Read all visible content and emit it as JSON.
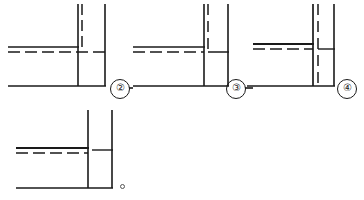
{
  "page": {
    "title": "Technical line drawings — four junction section views",
    "background_color": "#ffffff",
    "line_color": "#1a1a1a",
    "width": 364,
    "height": 200
  },
  "figures": [
    {
      "id": "figure-1",
      "label": "②",
      "label_name": "figure-label-2",
      "description": "Section junction view with solid outline, dashed centre line and dashed hidden vertical line",
      "origin": {
        "x": 8,
        "y": 4
      },
      "size": {
        "width": 108,
        "height": 86
      },
      "elements": {
        "vertical_solid_left": {
          "x": 78,
          "y1": 4,
          "y2": 86
        },
        "vertical_solid_right": {
          "x": 105,
          "y1": 4,
          "y2": 86
        },
        "vertical_dashed": {
          "x": 82,
          "y1": 4,
          "y2": 52
        },
        "horizontal_solid_upper": {
          "y": 47,
          "x1": 8,
          "x2": 78
        },
        "horizontal_dashed_center": {
          "y": 52,
          "x1": 8,
          "x2": 110
        },
        "horizontal_solid_bottom": {
          "y": 86,
          "x1": 8,
          "x2": 105
        }
      }
    },
    {
      "id": "figure-2",
      "label": "③",
      "label_name": "figure-label-3",
      "description": "Section junction view with solid outline, dashed centre line and short dashed hidden vertical line",
      "origin": {
        "x": 133,
        "y": 4
      },
      "size": {
        "width": 108,
        "height": 86
      },
      "elements": {
        "vertical_solid_left": {
          "x": 204,
          "y1": 4,
          "y2": 86
        },
        "vertical_solid_right": {
          "x": 228,
          "y1": 4,
          "y2": 86
        },
        "vertical_dashed": {
          "x": 208,
          "y1": 4,
          "y2": 52
        },
        "horizontal_solid_upper": {
          "y": 47,
          "x1": 133,
          "x2": 204
        },
        "horizontal_dashed_center": {
          "y": 52,
          "x1": 133,
          "x2": 204
        },
        "horizontal_solid_right_stub": {
          "y": 52,
          "x1": 208,
          "x2": 228
        },
        "horizontal_solid_bottom": {
          "y": 86,
          "x1": 133,
          "x2": 228
        }
      }
    },
    {
      "id": "figure-3",
      "label": "④",
      "label_name": "figure-label-4",
      "description": "Section junction view with full-height dashed hidden vertical line alongside solid vertical line",
      "origin": {
        "x": 253,
        "y": 4
      },
      "size": {
        "width": 100,
        "height": 86
      },
      "elements": {
        "vertical_solid_left": {
          "x": 313,
          "y1": 4,
          "y2": 86
        },
        "vertical_solid_right": {
          "x": 334,
          "y1": 4,
          "y2": 86
        },
        "vertical_dashed": {
          "x": 318,
          "y1": 4,
          "y2": 86
        },
        "horizontal_solid_upper": {
          "y": 44,
          "x1": 253,
          "x2": 313
        },
        "horizontal_dashed_center": {
          "y": 49,
          "x1": 253,
          "x2": 313
        },
        "horizontal_solid_right_stub": {
          "y": 49,
          "x1": 318,
          "x2": 334
        },
        "horizontal_solid_bottom": {
          "y": 86,
          "x1": 247,
          "x2": 334
        }
      }
    },
    {
      "id": "figure-4",
      "label": "",
      "label_name": "figure-label-none",
      "description": "Section junction view with solid verticals only, solid upper line and dashed centre line",
      "origin": {
        "x": 16,
        "y": 110
      },
      "size": {
        "width": 100,
        "height": 78
      },
      "elements": {
        "vertical_solid_left": {
          "x": 88,
          "y1": 110,
          "y2": 188
        },
        "vertical_solid_right": {
          "x": 112,
          "y1": 110,
          "y2": 188
        },
        "horizontal_solid_upper": {
          "y": 148,
          "x1": 16,
          "x2": 88
        },
        "horizontal_dashed_center": {
          "y": 153,
          "x1": 16,
          "x2": 88
        },
        "horizontal_solid_right_stub": {
          "y": 150,
          "x1": 92,
          "x2": 112
        },
        "horizontal_solid_bottom": {
          "y": 188,
          "x1": 16,
          "x2": 112
        }
      }
    }
  ],
  "markers": {
    "label_2": {
      "text": "②",
      "x": 112,
      "y": 79
    },
    "label_3": {
      "text": "③",
      "x": 228,
      "y": 79
    },
    "label_4": {
      "text": "④",
      "x": 338,
      "y": 79
    },
    "connector_after_2": {
      "y": 88,
      "x1": 130,
      "x2": 133
    },
    "connector_after_3": {
      "y": 88,
      "x1": 246,
      "x2": 253
    },
    "tiny_circle": {
      "x": 120,
      "y": 184
    }
  }
}
